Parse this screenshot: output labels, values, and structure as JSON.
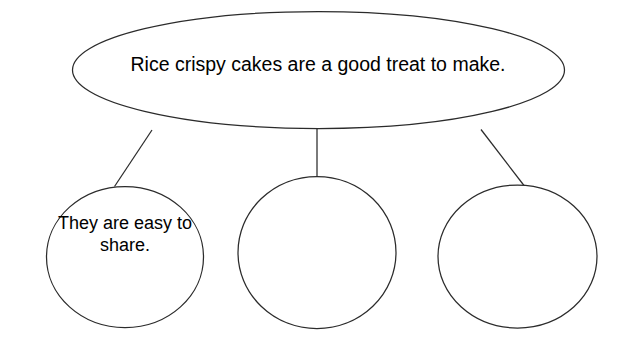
{
  "diagram": {
    "type": "concept-map",
    "main_idea": {
      "shape": "ellipse",
      "text": "Rice crispy cakes are a good treat to make."
    },
    "branches": [
      {
        "shape": "circle",
        "position": "left",
        "text": "They are easy to share.",
        "filled": "true"
      },
      {
        "shape": "circle",
        "position": "middle",
        "text": "",
        "filled": "false"
      },
      {
        "shape": "circle",
        "position": "right",
        "text": "",
        "filled": "false"
      }
    ],
    "connector_count": "3",
    "colors": {
      "background": "#ffffff",
      "stroke": "#2b2b2b",
      "text": "#000000"
    }
  }
}
